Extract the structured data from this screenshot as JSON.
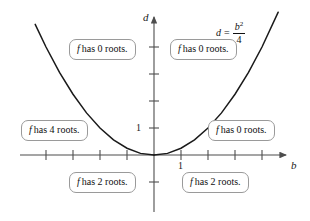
{
  "figure": {
    "background_color": "#ffffff",
    "curve_color": "#1a1a1a",
    "axis_color": "#4d4d4d",
    "box_border_color": "#9a9a9a",
    "text_color": "#111111"
  },
  "axes": {
    "x_axis_label": "b",
    "y_axis_label": "d",
    "x_tick_label": "1",
    "y_tick_label": "1",
    "x_ticks": [
      -4,
      -3,
      -2,
      -1,
      1,
      2,
      3,
      4
    ],
    "y_ticks": [
      1,
      2,
      3,
      4
    ],
    "x_range": [
      -4.9,
      4.9
    ],
    "y_range": [
      -2.4,
      4.9
    ],
    "origin_px": [
      154,
      155
    ],
    "unit_px": 27
  },
  "equation": {
    "lhs": "d",
    "equals": "=",
    "numerator": "b",
    "numerator_exponent": "2",
    "denominator": "4",
    "plain": "d = b^2/4"
  },
  "callouts": [
    {
      "id": "upper-left",
      "variable": "f",
      "text": "has 0 roots."
    },
    {
      "id": "upper-right",
      "variable": "f",
      "text": "has 0 roots."
    },
    {
      "id": "mid-left",
      "variable": "f",
      "text": "has 4 roots."
    },
    {
      "id": "mid-right",
      "variable": "f",
      "text": "has 0 roots."
    },
    {
      "id": "lower-left",
      "variable": "f",
      "text": "has 2 roots."
    },
    {
      "id": "lower-right",
      "variable": "f",
      "text": "has 2 roots."
    }
  ],
  "chart_data": {
    "type": "line",
    "title": "",
    "xlabel": "b",
    "ylabel": "d",
    "xlim": [
      -4.9,
      4.9
    ],
    "ylim": [
      -2.4,
      4.9
    ],
    "grid": false,
    "legend": "none",
    "series": [
      {
        "name": "d = b^2/4",
        "equation": "d = b^2/4",
        "x": [
          -4.4,
          -4.0,
          -3.5,
          -3.0,
          -2.5,
          -2.0,
          -1.5,
          -1.0,
          -0.5,
          0.0,
          0.5,
          1.0,
          1.5,
          2.0,
          2.5,
          3.0,
          3.5,
          4.0,
          4.6
        ],
        "y": [
          4.84,
          4.0,
          3.06,
          2.25,
          1.56,
          1.0,
          0.56,
          0.25,
          0.06,
          0.0,
          0.06,
          0.25,
          0.56,
          1.0,
          1.56,
          2.25,
          3.06,
          4.0,
          5.29
        ]
      }
    ],
    "annotations": [
      {
        "text": "f has 0 roots.",
        "region": "above parabola, b < 0"
      },
      {
        "text": "f has 0 roots.",
        "region": "above parabola, b > 0"
      },
      {
        "text": "f has 4 roots.",
        "region": "below parabola, d > 0, b < 0"
      },
      {
        "text": "f has 0 roots.",
        "region": "below parabola, d > 0, b > 0"
      },
      {
        "text": "f has 2 roots.",
        "region": "d < 0, b < 0"
      },
      {
        "text": "f has 2 roots.",
        "region": "d < 0, b > 0"
      }
    ]
  }
}
